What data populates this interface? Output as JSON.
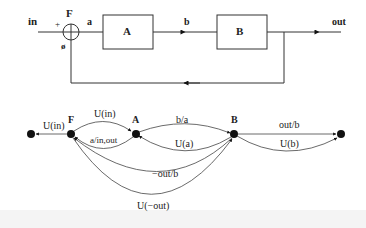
{
  "block_diagram": {
    "input_label": "in",
    "output_label": "out",
    "summing_junction": {
      "label": "F",
      "plus_sign": "+",
      "minus_sign": "ø"
    },
    "signals": {
      "a": "a",
      "b": "b"
    },
    "blocks": [
      {
        "id": "A",
        "label": "A"
      },
      {
        "id": "B",
        "label": "B"
      }
    ]
  },
  "flow_graph": {
    "nodes": [
      {
        "id": "in_node",
        "label": ""
      },
      {
        "id": "F",
        "label": "F"
      },
      {
        "id": "A",
        "label": "A"
      },
      {
        "id": "B",
        "label": "B"
      },
      {
        "id": "out_node",
        "label": ""
      }
    ],
    "edges": [
      {
        "from": "F",
        "to": "in_node",
        "label": "U(in)"
      },
      {
        "from": "F",
        "to": "A",
        "label": "U(in)"
      },
      {
        "from": "A",
        "to": "F",
        "label": "a/in,out"
      },
      {
        "from": "A",
        "to": "B",
        "label": "b/a"
      },
      {
        "from": "B",
        "to": "A",
        "label": "U(a)"
      },
      {
        "from": "B",
        "to": "F",
        "label": "−out/b"
      },
      {
        "from": "F",
        "to": "B",
        "label": "U(−out)"
      },
      {
        "from": "B",
        "to": "out_node",
        "label": "out/b"
      },
      {
        "from": "B",
        "to": "out_node",
        "label": "U(b)"
      }
    ]
  }
}
